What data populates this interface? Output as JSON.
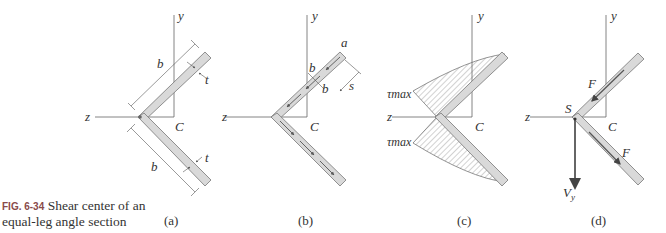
{
  "caption": {
    "figure_number": "FIG. 6-34",
    "line1": "Shear center of an",
    "line2": "equal-leg angle section"
  },
  "panels": [
    {
      "id": "a",
      "label": "(a)",
      "axis_y": "y",
      "axis_z": "z",
      "centroid": "C",
      "dim_leg_upper": "b",
      "dim_leg_lower": "b",
      "thickness_upper": "t",
      "thickness_lower": "t"
    },
    {
      "id": "b",
      "label": "(b)",
      "axis_y": "y",
      "axis_z": "z",
      "centroid": "C",
      "end_label": "a",
      "section_cut_top": "b",
      "section_cut_bottom": "b",
      "coordinate": "s"
    },
    {
      "id": "c",
      "label": "(c)",
      "axis_y": "y",
      "axis_z": "z",
      "centroid": "C",
      "stress_upper": "τmax",
      "stress_lower": "τmax"
    },
    {
      "id": "d",
      "label": "(d)",
      "axis_y": "y",
      "axis_z": "z",
      "centroid": "C",
      "shear_center": "S",
      "force_upper": "F",
      "force_lower": "F",
      "shear_force": "V",
      "shear_force_sub": "y"
    }
  ],
  "colors": {
    "line": "#555555",
    "leg_fill": "#d9d9d9",
    "leg_stroke": "#777777",
    "arrow": "#555555",
    "caption_fig": "#8a4a4a"
  }
}
